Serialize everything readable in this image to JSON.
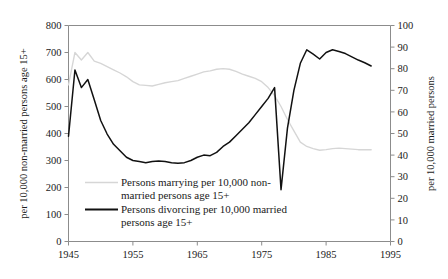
{
  "chart_data": {
    "type": "line",
    "title": "",
    "xlabel": "",
    "ylabel": "per 10,000 non-married persons age 15+",
    "y2label": "per 10,000 married persons",
    "xlim": [
      1945,
      1995
    ],
    "ylim": [
      0,
      800
    ],
    "y2lim": [
      0,
      100
    ],
    "xticks": [
      1945,
      1955,
      1965,
      1975,
      1985,
      1995
    ],
    "xticklabels": [
      "1945",
      "1955",
      "1965",
      "1975",
      "1985",
      "1995"
    ],
    "yticks": [
      0,
      100,
      200,
      300,
      400,
      500,
      600,
      700,
      800
    ],
    "yticklabels": [
      "0",
      "100",
      "200",
      "300",
      "400",
      "500",
      "600",
      "700",
      "800"
    ],
    "y2ticks": [
      0,
      10,
      20,
      30,
      40,
      50,
      60,
      70,
      80,
      90,
      100
    ],
    "y2ticklabels": [
      "0",
      "10",
      "20",
      "30",
      "40",
      "50",
      "60",
      "70",
      "80",
      "90",
      "100"
    ],
    "grid": false,
    "legend_position": "lower-left-inside",
    "series": [
      {
        "name": "Persons marrying per 10,000 non-married persons age 15+",
        "axis": "left",
        "color": "#d6d6d6",
        "x": [
          1945,
          1946,
          1947,
          1948,
          1949,
          1950,
          1951,
          1952,
          1953,
          1954,
          1955,
          1956,
          1957,
          1958,
          1959,
          1960,
          1961,
          1962,
          1963,
          1964,
          1965,
          1966,
          1967,
          1968,
          1969,
          1970,
          1971,
          1972,
          1973,
          1974,
          1975,
          1976,
          1977,
          1978,
          1979,
          1980,
          1981,
          1982,
          1983,
          1984,
          1985,
          1986,
          1987,
          1988,
          1989,
          1990,
          1991,
          1992
        ],
        "values": [
          580,
          700,
          672,
          700,
          668,
          660,
          648,
          636,
          624,
          610,
          592,
          580,
          578,
          576,
          582,
          588,
          592,
          596,
          604,
          612,
          620,
          628,
          632,
          638,
          640,
          638,
          630,
          620,
          612,
          604,
          592,
          570,
          540,
          500,
          452,
          410,
          368,
          352,
          344,
          338,
          340,
          344,
          346,
          344,
          342,
          340,
          340,
          340
        ]
      },
      {
        "name": "Persons divorcing per 10,000 married persons age 15+",
        "axis": "right",
        "color": "#111111",
        "x": [
          1945,
          1946,
          1947,
          1948,
          1949,
          1950,
          1951,
          1952,
          1953,
          1954,
          1955,
          1956,
          1957,
          1958,
          1959,
          1960,
          1961,
          1962,
          1963,
          1964,
          1965,
          1966,
          1967,
          1968,
          1969,
          1970,
          1971,
          1972,
          1973,
          1974,
          1975,
          1976,
          1977,
          1978,
          1979,
          1980,
          1981,
          1982,
          1983,
          1984,
          1985,
          1986,
          1987,
          1988,
          1989,
          1990,
          1991,
          1992
        ],
        "values_left_scale": [
          390,
          635,
          570,
          600,
          525,
          448,
          398,
          360,
          336,
          312,
          300,
          296,
          292,
          296,
          298,
          296,
          292,
          290,
          292,
          300,
          312,
          320,
          318,
          330,
          352,
          368,
          392,
          416,
          440,
          470,
          500,
          530,
          570,
          192,
          420,
          560,
          660,
          710,
          694,
          676,
          700,
          710,
          704,
          696,
          684,
          672,
          662,
          650
        ]
      }
    ],
    "legend": [
      {
        "label_line1": "Persons marrying per 10,000 non-",
        "label_line2": "married persons age 15+",
        "color": "#d6d6d6"
      },
      {
        "label_line1": "Persons divorcing per 10,000 married",
        "label_line2": "persons age 15+",
        "color": "#111111"
      }
    ]
  }
}
